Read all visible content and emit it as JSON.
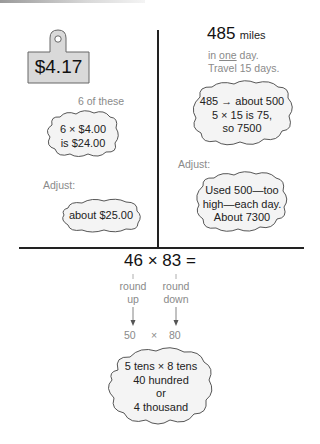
{
  "left_panel": {
    "price_tag": "$4.17",
    "quantity_label": "6 of these",
    "estimate_cloud": [
      "6 × $4.00",
      "is $24.00"
    ],
    "adjust_label": "Adjust:",
    "adjusted_cloud": "about $25.00"
  },
  "right_panel": {
    "distance_number": "485",
    "distance_unit": "miles",
    "line1_pre": "in ",
    "line1_emph": "one",
    "line1_post": " day.",
    "line2": "Travel 15 days.",
    "estimate_cloud": [
      "485 → about 500",
      "5 × 15 is 75,",
      "so 7500"
    ],
    "adjust_label": "Adjust:",
    "adjusted_cloud": [
      "Used 500—too",
      "high—each day.",
      "About 7300"
    ]
  },
  "bottom_panel": {
    "equation": "46 × 83 =",
    "left_round": [
      "round",
      "up"
    ],
    "right_round": [
      "round",
      "down"
    ],
    "rounded_left": "50",
    "times": "×",
    "rounded_right": "80",
    "result_cloud": [
      "5 tens × 8 tens",
      "40 hundred",
      "or",
      "4 thousand"
    ]
  },
  "colors": {
    "tag_fill": "#d9d9d9",
    "cloud_fill": "#f4f4f4",
    "line": "#222222",
    "muted_text": "#8a8a8a"
  }
}
